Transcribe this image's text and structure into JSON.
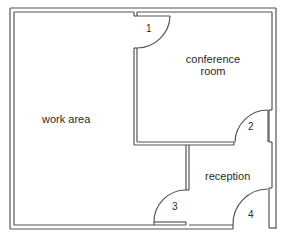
{
  "diagram": {
    "type": "floor-plan",
    "rooms": [
      {
        "id": "work-area",
        "label": "work area"
      },
      {
        "id": "conference-room",
        "label_line1": "conference",
        "label_line2": "room"
      },
      {
        "id": "reception",
        "label": "reception"
      }
    ],
    "doors": [
      {
        "id": "door-1",
        "label": "1"
      },
      {
        "id": "door-2",
        "label": "2"
      },
      {
        "id": "door-3",
        "label": "3"
      },
      {
        "id": "door-4",
        "label": "4"
      }
    ],
    "colors": {
      "wall": "#555555",
      "text": "#2a2a2a",
      "background": "#ffffff"
    }
  }
}
